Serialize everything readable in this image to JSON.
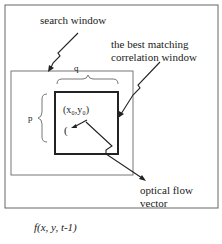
{
  "labels": {
    "search_window": "search window",
    "best_match_line1": "the best matching",
    "best_match_line2": "correlation window",
    "q": "q",
    "p": "p",
    "origin": "(x₀,y₀)",
    "paren": "(",
    "optical_flow_line1": "optical flow",
    "optical_flow_line2": "vector",
    "caption": "f(x, y, t-1)"
  },
  "colors": {
    "stroke": "#333333",
    "frame": "#555555",
    "background": "#ffffff"
  }
}
